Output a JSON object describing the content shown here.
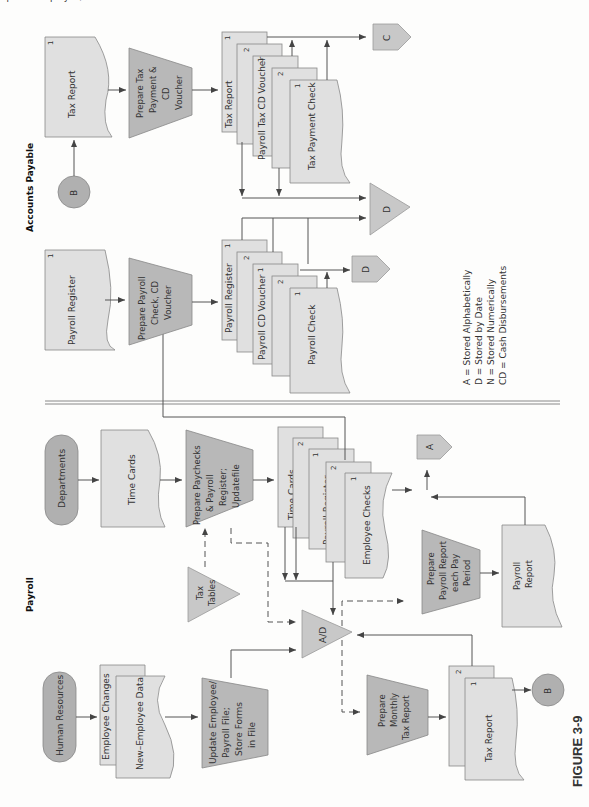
{
  "figure": {
    "caption": "FIGURE 3-9",
    "orientation": "rotated 90° counter-clockwise"
  },
  "sections": {
    "payroll": "Payroll",
    "accounts_payable": "Accounts Payable"
  },
  "payroll": {
    "human_resources": "Human Resources",
    "employee_changes": "Employee Changes",
    "new_employee_data": "New–Employee Data",
    "update_process": [
      "Update Employee/",
      "Payroll File;",
      "Store Forms",
      "in File"
    ],
    "departments": "Departments",
    "time_cards": "Time Cards",
    "prepare_paychecks": [
      "Prepare Paychecks",
      "& Payroll",
      "Register;",
      "Updatefile"
    ],
    "tax_tables": [
      "Tax",
      "Tables"
    ],
    "output_docs": [
      {
        "label": "Time Cards",
        "num": ""
      },
      {
        "label": "",
        "num": "2"
      },
      {
        "label": "Payroll Register",
        "num": "1"
      },
      {
        "label": "",
        "num": "2"
      },
      {
        "label": "Employee Checks",
        "num": "1"
      }
    ],
    "ad_file": "A/D",
    "a_file": "A",
    "prepare_payroll_report": [
      "Prepare",
      "Payroll Report",
      "each Pay",
      "Period"
    ],
    "payroll_report": [
      "Payroll",
      "Report"
    ],
    "prepare_monthly_tax": [
      "Prepare",
      "Monthly",
      "Tax Report"
    ],
    "tax_report_docs": [
      {
        "label": "",
        "num": "2"
      },
      {
        "label": "Tax Report",
        "num": "1"
      }
    ],
    "connector_b": "B"
  },
  "accounts_payable": {
    "payroll_register": {
      "label": "Payroll Register",
      "num": "1"
    },
    "prepare_payroll_check": [
      "Prepare Payroll",
      "Check, CD",
      "Voucher"
    ],
    "payroll_output_docs": [
      {
        "label": "Payroll Register",
        "num": "1"
      },
      {
        "label": "",
        "num": "2"
      },
      {
        "label": "Payroll CD Voucher",
        "num": "1"
      },
      {
        "label": "",
        "num": "2"
      },
      {
        "label": "Payroll Check",
        "num": "1"
      }
    ],
    "d_file_small": "D",
    "d_file_large": "D",
    "connector_b": "B",
    "tax_report": {
      "label": "Tax Report",
      "num": "1"
    },
    "prepare_tax_payment": [
      "Prepare Tax",
      "Payment &",
      "CD",
      "Voucher"
    ],
    "tax_output_docs": [
      {
        "label": "Tax Report",
        "num": "1"
      },
      {
        "label": "",
        "num": "2"
      },
      {
        "label": "Payroll Tax CD Voucher",
        "num": "1"
      },
      {
        "label": "",
        "num": "2"
      },
      {
        "label": "Tax Payment Check",
        "num": "1"
      }
    ],
    "c_connector": "C"
  },
  "legend": [
    "A = Stored Alphabetically",
    "D = Stored by Date",
    "N = Stored Numerically",
    "CD = Cash Disbursements"
  ]
}
